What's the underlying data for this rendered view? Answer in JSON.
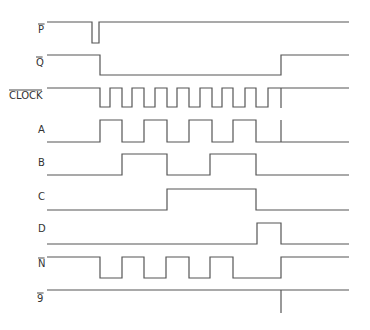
{
  "x_start": 47,
  "x_end": 349,
  "marker_x": 281,
  "signals": [
    {
      "name": "P",
      "label": "P",
      "overline": true,
      "label_x": 38,
      "label_y": 33,
      "high_y": 22,
      "low_y": 43,
      "initial": "high",
      "transitions": [
        92,
        99
      ]
    },
    {
      "name": "Q",
      "label": "Q",
      "overline": true,
      "label_x": 36,
      "label_y": 66,
      "high_y": 55,
      "low_y": 75,
      "initial": "high",
      "transitions": [
        100,
        281
      ]
    },
    {
      "name": "CLOCK",
      "label": "CLOCK",
      "overline": true,
      "label_x": 9,
      "label_y": 99,
      "high_y": 88,
      "low_y": 107,
      "initial": "high",
      "transitions": [
        100,
        110,
        122,
        132,
        144,
        155,
        167,
        177,
        189,
        200,
        212,
        222,
        233,
        245,
        256,
        268
      ]
    },
    {
      "name": "A",
      "label": "A",
      "overline": false,
      "label_x": 38,
      "label_y": 133,
      "high_y": 120,
      "low_y": 142,
      "initial": "low",
      "transitions": [
        100,
        122,
        144,
        167,
        189,
        212,
        233,
        256
      ]
    },
    {
      "name": "B",
      "label": "B",
      "overline": false,
      "label_x": 38,
      "label_y": 166,
      "high_y": 154,
      "low_y": 175,
      "initial": "low",
      "transitions": [
        122,
        167,
        210,
        256
      ]
    },
    {
      "name": "C",
      "label": "C",
      "overline": false,
      "label_x": 38,
      "label_y": 200,
      "high_y": 189,
      "low_y": 210,
      "initial": "low",
      "transitions": [
        167,
        256
      ]
    },
    {
      "name": "D",
      "label": "D",
      "overline": false,
      "label_x": 38,
      "label_y": 232,
      "high_y": 223,
      "low_y": 244,
      "initial": "low",
      "transitions": [
        257,
        281
      ]
    },
    {
      "name": "N",
      "label": "N",
      "overline": true,
      "label_x": 38,
      "label_y": 267,
      "high_y": 257,
      "low_y": 278,
      "initial": "high",
      "transitions": [
        100,
        122,
        144,
        166,
        189,
        210,
        233,
        281
      ]
    },
    {
      "name": "9",
      "label": "9",
      "overline": true,
      "label_x": 37,
      "label_y": 302,
      "high_y": 290,
      "low_y": 290,
      "initial": "high",
      "transitions": []
    }
  ],
  "markers": [
    {
      "x": 281,
      "y1": 88,
      "y2": 108
    },
    {
      "x": 281,
      "y1": 120,
      "y2": 142
    },
    {
      "x": 281,
      "y1": 290,
      "y2": 313
    }
  ]
}
